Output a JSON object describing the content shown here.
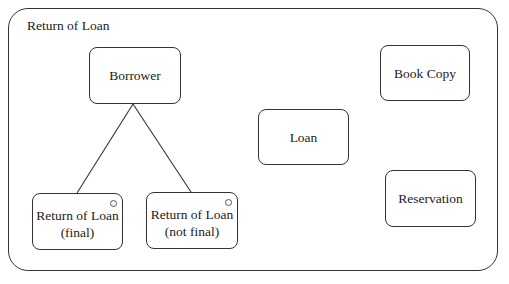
{
  "diagram": {
    "frame_title": "Return of Loan",
    "nodes": {
      "borrower": {
        "label": "Borrower"
      },
      "return_final": {
        "line1": "Return of Loan",
        "line2": "(final)"
      },
      "return_not_final": {
        "line1": "Return of Loan",
        "line2": "(not final)"
      },
      "loan": {
        "label": "Loan"
      },
      "book_copy": {
        "label": "Book Copy"
      },
      "reservation": {
        "label": "Reservation"
      }
    },
    "edges": [
      {
        "from": "borrower",
        "to": "return_final"
      },
      {
        "from": "borrower",
        "to": "return_not_final"
      }
    ]
  }
}
